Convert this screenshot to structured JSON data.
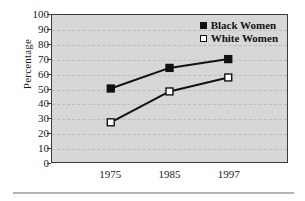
{
  "chart_data": {
    "type": "line",
    "title": "",
    "xlabel": "",
    "ylabel": "Percentage",
    "categories": [
      "1975",
      "1985",
      "1997"
    ],
    "ylim": [
      0,
      100
    ],
    "yticks": [
      0,
      10,
      20,
      30,
      40,
      50,
      60,
      70,
      80,
      90,
      100
    ],
    "grid": true,
    "legend_position": "top-right-inside",
    "series": [
      {
        "name": "Black Women",
        "marker": "filled-square",
        "color": "#111111",
        "values": [
          50,
          64,
          70
        ]
      },
      {
        "name": "White Women",
        "marker": "open-square",
        "color": "#ffffff",
        "values": [
          27,
          48,
          57.5
        ]
      }
    ]
  },
  "axis": {
    "y_title": "Percentage",
    "y_tick_labels": [
      "0",
      "10",
      "20",
      "30",
      "40",
      "50",
      "60",
      "70",
      "80",
      "90",
      "100"
    ],
    "x_tick_labels": [
      "1975",
      "1985",
      "1997"
    ]
  },
  "legend": {
    "items": [
      {
        "label": "Black Women",
        "swatch": "filled-square-marker"
      },
      {
        "label": "White Women",
        "swatch": "open-square-marker"
      }
    ]
  },
  "colors": {
    "plot_background": "#d7d7d7",
    "plot_border": "#3a3a3a",
    "gridline": "#bdbdbd",
    "series_line": "#111111",
    "text": "#1b1b1b",
    "bottom_rule": "#b4b4b4"
  }
}
